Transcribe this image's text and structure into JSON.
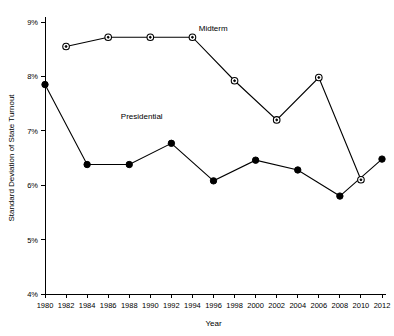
{
  "chart_data": {
    "type": "line",
    "title": "",
    "xlabel": "Year",
    "ylabel": "Standard Deviation of State Turnout",
    "x": [
      1980,
      1982,
      1984,
      1986,
      1988,
      1990,
      1992,
      1994,
      1996,
      1998,
      2000,
      2002,
      2004,
      2006,
      2008,
      2010,
      2012
    ],
    "xtick_labels": [
      "1980",
      "1982",
      "1984",
      "1986",
      "1988",
      "1990",
      "1992",
      "1994",
      "1996",
      "1998",
      "2000",
      "2002",
      "2004",
      "2006",
      "2008",
      "2010",
      "2012"
    ],
    "xlim": [
      1980,
      2012
    ],
    "ylim": [
      4,
      9
    ],
    "ytick_values": [
      4,
      5,
      6,
      7,
      8,
      9
    ],
    "ytick_labels": [
      "4%",
      "5%",
      "6%",
      "7%",
      "8%",
      "9%"
    ],
    "grid": false,
    "legend_position": "inline-annotations",
    "series": [
      {
        "name": "Presidential",
        "marker": "filled-circle",
        "label_annotation": "Presidential",
        "x": [
          1980,
          1984,
          1988,
          1992,
          1996,
          2000,
          2004,
          2008,
          2012
        ],
        "values": [
          7.85,
          6.38,
          6.38,
          6.77,
          6.08,
          6.46,
          6.28,
          5.8,
          6.48
        ]
      },
      {
        "name": "Midterm",
        "marker": "open-circle",
        "label_annotation": "Midterm",
        "x": [
          1982,
          1986,
          1990,
          1994,
          1998,
          2002,
          2006,
          2010
        ],
        "values": [
          8.55,
          8.72,
          8.72,
          8.72,
          7.92,
          7.2,
          7.98,
          6.1
        ]
      }
    ],
    "annotations": [
      {
        "text": "Presidential",
        "x": 1987.2,
        "y": 7.21
      },
      {
        "text": "Midterm",
        "x": 1994.6,
        "y": 8.83
      }
    ]
  }
}
